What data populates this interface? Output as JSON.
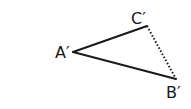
{
  "diagram": {
    "type": "triangle",
    "vertices": [
      {
        "label": "A′",
        "x": 73,
        "y": 52
      },
      {
        "label": "B′",
        "x": 176,
        "y": 79
      },
      {
        "label": "C′",
        "x": 147,
        "y": 26
      }
    ],
    "edges": [
      {
        "from": "A′",
        "to": "C′",
        "style": "solid"
      },
      {
        "from": "A′",
        "to": "B′",
        "style": "solid"
      },
      {
        "from": "C′",
        "to": "B′",
        "style": "dotted"
      }
    ],
    "stroke_color": "#1a1a1a"
  }
}
